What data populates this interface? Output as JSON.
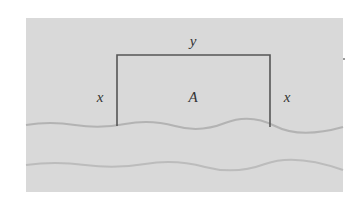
{
  "figure": {
    "labels": {
      "top": "y",
      "left": "x",
      "center": "A",
      "right": "x"
    },
    "colors": {
      "background": "#d9d9d9",
      "fence": "#555555",
      "river_line": "#b5b5b5",
      "text": "#333333"
    }
  }
}
